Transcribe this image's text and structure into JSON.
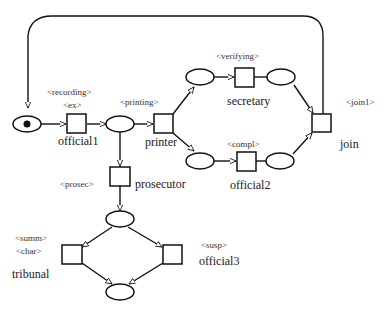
{
  "diagram": {
    "type": "petri-net",
    "places": [
      {
        "id": "p_start",
        "token": true
      },
      {
        "id": "p_after_official1"
      },
      {
        "id": "p_top_left"
      },
      {
        "id": "p_top_right"
      },
      {
        "id": "p_bottom_left"
      },
      {
        "id": "p_bottom_right"
      },
      {
        "id": "p_after_prosecutor"
      },
      {
        "id": "p_end"
      }
    ],
    "transitions": [
      {
        "id": "t_official1",
        "name": "official1",
        "tags": [
          "<recording>",
          "<ex>"
        ]
      },
      {
        "id": "t_printer",
        "name": "printer",
        "tags": [
          "<printing>"
        ]
      },
      {
        "id": "t_secretary",
        "name": "secretary",
        "tags": [
          "<verifying>"
        ]
      },
      {
        "id": "t_official2",
        "name": "official2",
        "tags": [
          "<compl>"
        ]
      },
      {
        "id": "t_join",
        "name": "join",
        "tags": [
          "<join1>"
        ]
      },
      {
        "id": "t_prosecutor",
        "name": "prosecutor",
        "tags": [
          "<prosec>"
        ]
      },
      {
        "id": "t_tribunal",
        "name": "tribunal",
        "tags": [
          "<summ>",
          "<char>"
        ]
      },
      {
        "id": "t_official3",
        "name": "official3",
        "tags": [
          "<susp>"
        ]
      }
    ],
    "labels": {
      "recording": "<recording>",
      "ex": "<ex>",
      "official1": "official1",
      "printing": "<printing>",
      "printer": "printer",
      "verifying": "<verifying>",
      "secretary": "secretary",
      "compl": "<compl>",
      "official2": "official2",
      "join1": "<join1>",
      "join": "join",
      "prosec": "<prosec>",
      "prosecutor": "prosecutor",
      "summ": "<summ>",
      "char": "<char>",
      "tribunal": "tribunal",
      "susp": "<susp>",
      "official3": "official3"
    },
    "colors": {
      "stroke": "#111111",
      "background": "#ffffff"
    }
  }
}
